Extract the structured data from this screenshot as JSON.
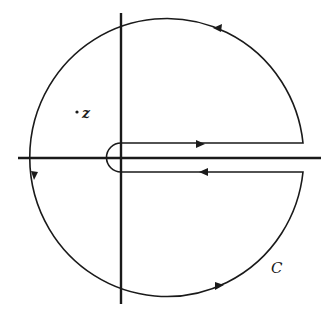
{
  "diagram": {
    "type": "keyhole-contour",
    "labels": {
      "point": "z",
      "contour": "C"
    },
    "colors": {
      "stroke": "#1a1a1a",
      "background": "#ffffff"
    }
  }
}
